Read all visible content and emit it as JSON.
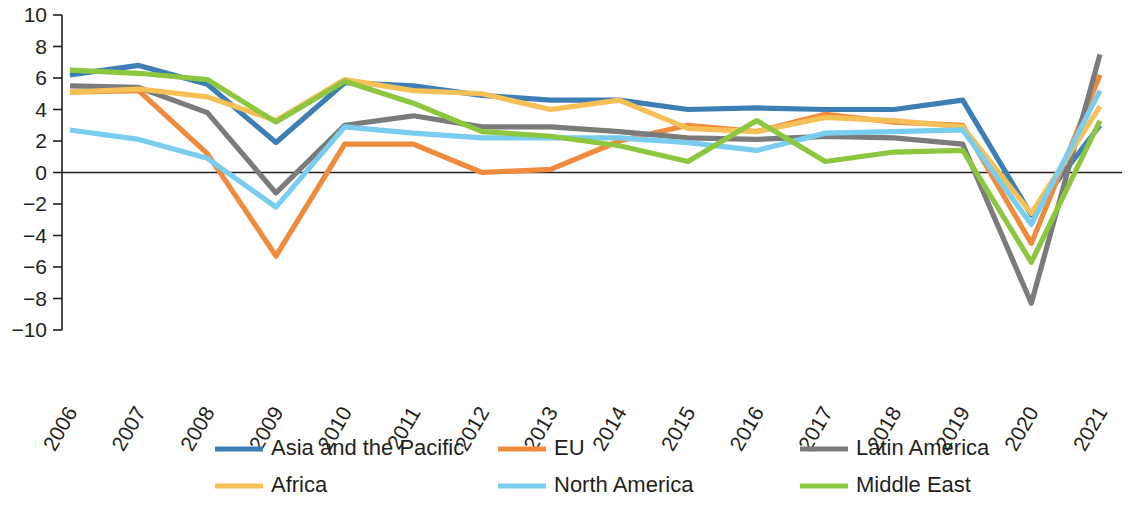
{
  "chart_data": {
    "type": "line",
    "title": "",
    "subtitle": "",
    "xlabel": "",
    "ylabel": "",
    "categories": [
      "2006",
      "2007",
      "2008",
      "2009",
      "2010",
      "2011",
      "2012",
      "2013",
      "2014",
      "2015",
      "2016",
      "2017",
      "2018",
      "2019",
      "2020",
      "2021"
    ],
    "ylim": [
      -10,
      10
    ],
    "xlim_years": [
      2006,
      2021
    ],
    "yticks": [
      10,
      8,
      6,
      4,
      2,
      0,
      -2,
      -4,
      -6,
      -8,
      -10
    ],
    "ytick_labels": [
      "10",
      "8",
      "6",
      "4",
      "2",
      "0",
      "−2",
      "−4",
      "−6",
      "−8",
      "−10"
    ],
    "grid": false,
    "zero_line": true,
    "legend_position": "bottom",
    "legend_columns": 3,
    "series": [
      {
        "name": "Asia and the Pacific",
        "color": "#3d7fb5",
        "values": [
          6.2,
          6.8,
          5.6,
          1.9,
          5.7,
          5.5,
          4.9,
          4.6,
          4.6,
          4.0,
          4.1,
          4.0,
          4.0,
          4.6,
          -2.7,
          3.0
        ]
      },
      {
        "name": "EU",
        "color": "#f08a3c",
        "values": [
          5.1,
          5.2,
          1.2,
          -5.3,
          1.8,
          1.8,
          0.0,
          0.2,
          2.0,
          3.0,
          2.6,
          3.7,
          3.2,
          3.0,
          -4.5,
          6.2
        ]
      },
      {
        "name": "Latin America",
        "color": "#7b7b7b",
        "values": [
          5.5,
          5.4,
          3.8,
          -1.3,
          3.0,
          3.6,
          2.9,
          2.9,
          2.6,
          2.2,
          2.1,
          2.3,
          2.2,
          1.8,
          -8.3,
          7.5
        ]
      },
      {
        "name": "Africa",
        "color": "#f5c055",
        "values": [
          5.1,
          5.3,
          4.8,
          3.3,
          5.9,
          5.2,
          5.0,
          4.0,
          4.6,
          2.8,
          2.6,
          3.5,
          3.3,
          2.9,
          -2.6,
          4.2
        ]
      },
      {
        "name": "North America",
        "color": "#79cdee",
        "values": [
          2.7,
          2.1,
          0.9,
          -2.2,
          2.9,
          2.5,
          2.2,
          2.2,
          2.2,
          1.9,
          1.4,
          2.5,
          2.6,
          2.7,
          -3.3,
          5.2
        ]
      },
      {
        "name": "Middle East",
        "color": "#8dc63f",
        "values": [
          6.5,
          6.3,
          5.9,
          3.2,
          5.8,
          4.4,
          2.6,
          2.3,
          1.7,
          0.7,
          3.3,
          0.7,
          1.3,
          1.4,
          -5.7,
          3.3
        ]
      }
    ]
  },
  "legend": {
    "entries": [
      {
        "label": "Asia and the Pacific",
        "color": "#3d7fb5"
      },
      {
        "label": "EU",
        "color": "#f08a3c"
      },
      {
        "label": "Latin America",
        "color": "#7b7b7b"
      },
      {
        "label": "Africa",
        "color": "#f5c055"
      },
      {
        "label": "North America",
        "color": "#79cdee"
      },
      {
        "label": "Middle East",
        "color": "#8dc63f"
      }
    ]
  }
}
